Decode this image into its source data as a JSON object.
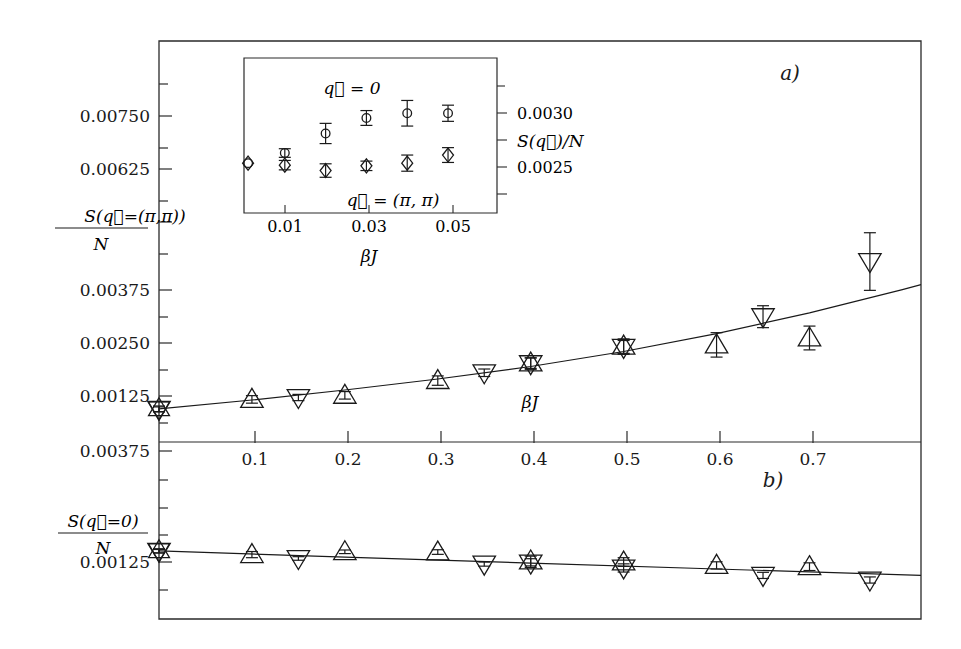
{
  "figure": {
    "width": 961,
    "height": 649,
    "background": "#ffffff",
    "ink_color": "#1a1a1a"
  },
  "chart_data": [
    {
      "id": "panel-a",
      "type": "scatter",
      "panel_label": "a)",
      "title": "",
      "xlabel": "βJ",
      "ylabel": "S(q⃗=(π,π))/N",
      "xlim": [
        0.0,
        0.82
      ],
      "ylim": [
        0.00195,
        0.00835
      ],
      "xticks": [
        0.1,
        0.2,
        0.3,
        0.4,
        0.5,
        0.6,
        0.7
      ],
      "xticklabels": [
        "0.1",
        "0.2",
        "0.3",
        "0.4",
        "0.5",
        "0.6",
        "0.7"
      ],
      "yticks": [
        0.00125,
        0.0025,
        0.00375,
        0.005,
        0.00625,
        0.0075
      ],
      "yticklabels_shown": [
        "0.00125",
        "0.00250",
        "0.00375",
        "0.00625",
        "0.00750"
      ],
      "grid": false,
      "legend_position": "none",
      "series": [
        {
          "name": "star",
          "marker": "star6",
          "points": [
            {
              "x": 0.0,
              "y": 0.00248,
              "yerr": 4.5e-05
            }
          ]
        },
        {
          "name": "up-triangle",
          "marker": "triangle-up",
          "points": [
            {
              "x": 0.1,
              "y": 0.00263,
              "yerr": 6e-05
            },
            {
              "x": 0.2,
              "y": 0.002695,
              "yerr": 6e-05
            },
            {
              "x": 0.3,
              "y": 0.00293,
              "yerr": 7.5e-05
            },
            {
              "x": 0.4,
              "y": 0.00321,
              "yerr": 8.5e-05
            },
            {
              "x": 0.5,
              "y": 0.00348,
              "yerr": 0.000115
            },
            {
              "x": 0.6,
              "y": 0.0035,
              "yerr": 0.000195
            },
            {
              "x": 0.7,
              "y": 0.00361,
              "yerr": 0.00019
            }
          ]
        },
        {
          "name": "down-triangle",
          "marker": "triangle-down",
          "points": [
            {
              "x": 0.0,
              "y": 0.00247,
              "yerr": 4e-05
            },
            {
              "x": 0.15,
              "y": 0.00266,
              "yerr": 5e-05
            },
            {
              "x": 0.35,
              "y": 0.003055,
              "yerr": 6e-05
            },
            {
              "x": 0.4,
              "y": 0.0032,
              "yerr": 9e-05
            },
            {
              "x": 0.5,
              "y": 0.00346,
              "yerr": 0.00011
            },
            {
              "x": 0.65,
              "y": 0.00395,
              "yerr": 0.000175
            },
            {
              "x": 0.765,
              "y": 0.00483,
              "yerr": 0.00046
            }
          ]
        }
      ],
      "fit_curve": {
        "name": "fit",
        "description": "upward curving fit through data",
        "points": [
          {
            "x": 0.0,
            "y": 0.00248
          },
          {
            "x": 0.1,
            "y": 0.00262
          },
          {
            "x": 0.2,
            "y": 0.00278
          },
          {
            "x": 0.3,
            "y": 0.002955
          },
          {
            "x": 0.4,
            "y": 0.003155
          },
          {
            "x": 0.5,
            "y": 0.003395
          },
          {
            "x": 0.6,
            "y": 0.00368
          },
          {
            "x": 0.7,
            "y": 0.00401
          },
          {
            "x": 0.8,
            "y": 0.00438
          },
          {
            "x": 0.82,
            "y": 0.00446
          }
        ]
      }
    },
    {
      "id": "panel-b",
      "type": "scatter",
      "panel_label": "b)",
      "title": "",
      "xlabel": "βJ",
      "ylabel": "S(q⃗=0)/N",
      "xlim": [
        0.0,
        0.82
      ],
      "ylim": [
        0.0007,
        0.00415
      ],
      "xticks": [
        0.1,
        0.2,
        0.3,
        0.4,
        0.5,
        0.6,
        0.7
      ],
      "xticklabels": [
        "0.1",
        "0.2",
        "0.3",
        "0.4",
        "0.5",
        "0.6",
        "0.7"
      ],
      "yticks": [
        0.00125,
        0.0025,
        0.00375
      ],
      "yticklabels_shown": [
        "0.00375",
        "0.00125"
      ],
      "grid": false,
      "legend_position": "none",
      "series": [
        {
          "name": "star",
          "marker": "star6",
          "points": [
            {
              "x": 0.0,
              "y": 0.00203,
              "yerr": 4e-05
            }
          ]
        },
        {
          "name": "up-triangle",
          "marker": "triangle-up",
          "points": [
            {
              "x": 0.1,
              "y": 0.001955,
              "yerr": 6e-05
            },
            {
              "x": 0.2,
              "y": 0.00201,
              "yerr": 3.5e-05
            },
            {
              "x": 0.3,
              "y": 0.002005,
              "yerr": 4.5e-05
            },
            {
              "x": 0.4,
              "y": 0.00183,
              "yerr": 9.5e-05
            },
            {
              "x": 0.5,
              "y": 0.00181,
              "yerr": 8.5e-05
            },
            {
              "x": 0.6,
              "y": 0.001745,
              "yerr": 7e-05
            },
            {
              "x": 0.7,
              "y": 0.00172,
              "yerr": 7.5e-05
            }
          ]
        },
        {
          "name": "down-triangle",
          "marker": "triangle-down",
          "points": [
            {
              "x": 0.0,
              "y": 0.00202,
              "yerr": 3.5e-05
            },
            {
              "x": 0.15,
              "y": 0.00188,
              "yerr": 3.5e-05
            },
            {
              "x": 0.35,
              "y": 0.00177,
              "yerr": 4e-05
            },
            {
              "x": 0.4,
              "y": 0.00179,
              "yerr": 8.5e-05
            },
            {
              "x": 0.5,
              "y": 0.001695,
              "yerr": 8e-05
            },
            {
              "x": 0.65,
              "y": 0.00155,
              "yerr": 6e-05
            },
            {
              "x": 0.765,
              "y": 0.00146,
              "yerr": 6e-05
            }
          ]
        }
      ],
      "fit_curve": {
        "name": "fit",
        "description": "slowly decreasing near-linear fit",
        "points": [
          {
            "x": 0.0,
            "y": 0.00203
          },
          {
            "x": 0.2,
            "y": 0.001905
          },
          {
            "x": 0.4,
            "y": 0.00179
          },
          {
            "x": 0.6,
            "y": 0.001675
          },
          {
            "x": 0.82,
            "y": 0.00155
          }
        ]
      }
    },
    {
      "id": "inset",
      "type": "scatter",
      "title": "",
      "xlabel": "βJ",
      "ylabel": "S(q⃗)/N",
      "xlim": [
        0.0,
        0.062
      ],
      "ylim": [
        0.00215,
        0.0033
      ],
      "xticks": [
        0.01,
        0.03,
        0.05
      ],
      "xticklabels": [
        "0.01",
        "0.03",
        "0.05"
      ],
      "yticks": [
        0.0025,
        0.003
      ],
      "yticklabels": [
        "0.0025",
        "0.0030"
      ],
      "grid": false,
      "legend_position": "inside",
      "annotations": [
        {
          "text": "q⃗ = 0",
          "x": 0.031,
          "y": 0.00318
        },
        {
          "text": "q⃗ = (π, π)",
          "x": 0.039,
          "y": 0.00228
        }
      ],
      "series": [
        {
          "name": "q = 0",
          "marker": "circle",
          "points": [
            {
              "x": 0.001,
              "y": 0.00252,
              "yerr": 0.0
            },
            {
              "x": 0.01,
              "y": 0.002595,
              "yerr": 3.2e-05
            },
            {
              "x": 0.02,
              "y": 0.00274,
              "yerr": 7.5e-05
            },
            {
              "x": 0.03,
              "y": 0.002855,
              "yerr": 5.5e-05
            },
            {
              "x": 0.04,
              "y": 0.00289,
              "yerr": 9.5e-05
            },
            {
              "x": 0.05,
              "y": 0.00289,
              "yerr": 6e-05
            }
          ]
        },
        {
          "name": "q = (pi, pi)",
          "marker": "diamond",
          "points": [
            {
              "x": 0.001,
              "y": 0.00252,
              "yerr": 0.0
            },
            {
              "x": 0.01,
              "y": 0.002505,
              "yerr": 3.5e-05
            },
            {
              "x": 0.02,
              "y": 0.002465,
              "yerr": 5e-05
            },
            {
              "x": 0.03,
              "y": 0.0025,
              "yerr": 3.5e-05
            },
            {
              "x": 0.04,
              "y": 0.00252,
              "yerr": 6e-05
            },
            {
              "x": 0.05,
              "y": 0.00258,
              "yerr": 5.5e-05
            }
          ]
        }
      ]
    }
  ],
  "labels": {
    "panel_a_tag": "a)",
    "panel_b_tag": "b)",
    "panel_a_ylabel_num": "S(q⃗=(π,π))",
    "panel_a_ylabel_den": "N",
    "panel_b_ylabel_num": "S(q⃗=0)",
    "panel_b_ylabel_den": "N",
    "xlabel_main_a": "βJ",
    "xlabel_main_b": "βJ",
    "inset_xlabel": "βJ",
    "inset_ylabel": "S(q⃗)/N",
    "inset_series_top": "q⃗ = 0",
    "inset_series_bottom": "q⃗ = (π, π)",
    "y_ticks_a": [
      "0.00750",
      "0.00625",
      "0.00375",
      "0.00250",
      "0.00125"
    ],
    "y_ticks_b": [
      "0.00375",
      "0.00125"
    ],
    "x_ticks": [
      "0.1",
      "0.2",
      "0.3",
      "0.4",
      "0.5",
      "0.6",
      "0.7"
    ],
    "inset_x_ticks": [
      "0.01",
      "0.03",
      "0.05"
    ],
    "inset_y_ticks": [
      "0.0030",
      "0.0025"
    ]
  }
}
